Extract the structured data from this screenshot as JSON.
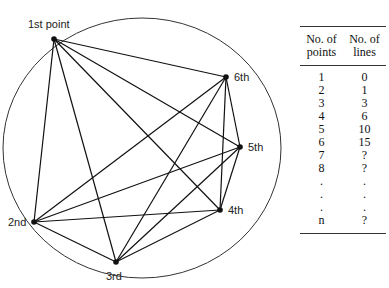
{
  "diagram": {
    "circle": {
      "cx": 142,
      "cy": 148,
      "rx": 139,
      "ry": 130
    },
    "points": [
      {
        "label": "1st point",
        "x": 54,
        "y": 39,
        "lx": 28,
        "ly": 28
      },
      {
        "label": "2nd",
        "x": 34,
        "y": 222,
        "lx": 8,
        "ly": 226
      },
      {
        "label": "3rd",
        "x": 116,
        "y": 262,
        "lx": 106,
        "ly": 280
      },
      {
        "label": "4th",
        "x": 220,
        "y": 210,
        "lx": 228,
        "ly": 214
      },
      {
        "label": "5th",
        "x": 240,
        "y": 147,
        "lx": 248,
        "ly": 151
      },
      {
        "label": "6th",
        "x": 226,
        "y": 77,
        "lx": 234,
        "ly": 81
      }
    ]
  },
  "table": {
    "headers": [
      "No. of points",
      "No. of lines"
    ],
    "header_lines": [
      [
        "No. of",
        "points"
      ],
      [
        "No. of",
        "lines"
      ]
    ],
    "rows": [
      [
        "1",
        "0"
      ],
      [
        "2",
        "1"
      ],
      [
        "3",
        "3"
      ],
      [
        "4",
        "6"
      ],
      [
        "5",
        "10"
      ],
      [
        "6",
        "15"
      ],
      [
        "7",
        "?"
      ],
      [
        "8",
        "?"
      ],
      [
        ".",
        "."
      ],
      [
        ".",
        "."
      ],
      [
        ".",
        "."
      ],
      [
        "n",
        "?"
      ]
    ]
  }
}
